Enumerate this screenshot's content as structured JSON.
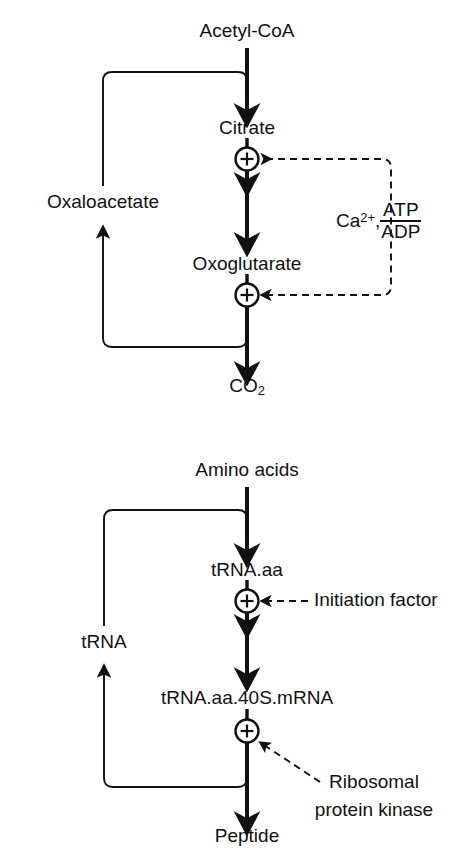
{
  "figure": {
    "background": "#ffffff",
    "ink": "#111111",
    "panels": [
      {
        "id": "tca-cycle",
        "name": "citric-acid-cycle-regulation",
        "nodes": [
          {
            "id": "acetyl-coa",
            "label": "Acetyl-CoA",
            "x": 247,
            "y": 34
          },
          {
            "id": "citrate",
            "label": "Citrate",
            "x": 247,
            "y": 130
          },
          {
            "id": "oxaloacetate",
            "label": "Oxaloacetate",
            "x": 103,
            "y": 204
          },
          {
            "id": "oxoglutarate",
            "label": "Oxoglutarate",
            "x": 247,
            "y": 266
          },
          {
            "id": "co2",
            "label": "CO",
            "sub": "2",
            "x": 247,
            "y": 388
          }
        ],
        "regulator": {
          "id": "ca-atp-adp",
          "ion": "Ca",
          "ion_charge": "2+",
          "separator": ",",
          "numerator": "ATP",
          "denominator": "ADP",
          "x": 340,
          "y": 218
        },
        "plus_nodes": [
          {
            "id": "plus-citrate",
            "sign": "+",
            "x": 247,
            "y": 159
          },
          {
            "id": "plus-oxoglutarate",
            "sign": "+",
            "x": 247,
            "y": 295
          }
        ],
        "recycle_label": "Oxaloacetate"
      },
      {
        "id": "protein-synthesis",
        "name": "protein-synthesis-regulation",
        "nodes": [
          {
            "id": "amino-acids",
            "label": "Amino acids",
            "x": 247,
            "y": 472
          },
          {
            "id": "trna-aa",
            "label": "tRNA.aa",
            "x": 247,
            "y": 572
          },
          {
            "id": "trna",
            "label": "tRNA",
            "x": 104,
            "y": 644
          },
          {
            "id": "trna-complex",
            "label": "tRNA.aa.40S.mRNA",
            "x": 247,
            "y": 700
          },
          {
            "id": "peptide",
            "label": "Peptide",
            "x": 247,
            "y": 838
          }
        ],
        "plus_nodes": [
          {
            "id": "plus-initiation",
            "sign": "+",
            "x": 247,
            "y": 601
          },
          {
            "id": "plus-ribosomal",
            "sign": "+",
            "x": 247,
            "y": 731
          }
        ],
        "regulators": [
          {
            "id": "initiation-factor",
            "label": "Initiation factor",
            "x": 318,
            "y": 601
          },
          {
            "id": "ribosomal-kinase-l1",
            "label": "Ribosomal",
            "x": 374,
            "y": 784
          },
          {
            "id": "ribosomal-kinase-l2",
            "label": "protein kinase",
            "x": 374,
            "y": 812
          }
        ]
      }
    ]
  }
}
